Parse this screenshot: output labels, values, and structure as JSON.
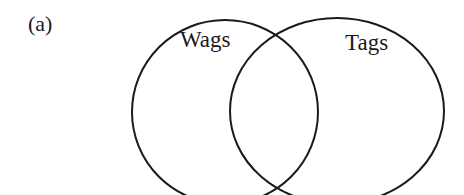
{
  "figure": {
    "panel_label": "(a)",
    "type": "venn-diagram",
    "sets": [
      {
        "name": "Wags",
        "label": "Wags",
        "cx": 225,
        "cy": 112,
        "rx": 93,
        "ry": 92
      },
      {
        "name": "Tags",
        "label": "Tags",
        "cx": 337,
        "cy": 111,
        "rx": 107,
        "ry": 93
      }
    ],
    "stroke_color": "#1a1a1a",
    "background": "#ffffff"
  }
}
